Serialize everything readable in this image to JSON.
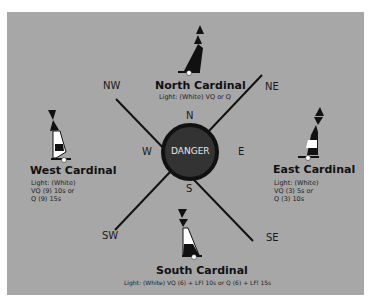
{
  "diagram": {
    "center": {
      "label": "DANGER",
      "fill": "#333333"
    },
    "directions": {
      "n": "N",
      "s": "S",
      "e": "E",
      "w": "W",
      "ne": "NE",
      "nw": "NW",
      "se": "SE",
      "sw": "SW"
    },
    "buoys": {
      "north": {
        "title": "North Cardinal",
        "light": "Light: (White) VQ or Q"
      },
      "east": {
        "title": "East Cardinal",
        "light_lines": [
          "Light: (White)",
          "VQ (3) 5s or",
          "Q (3) 10s"
        ]
      },
      "south": {
        "title": "South Cardinal",
        "light": "Light: (White) VQ (6) + LFl 10s or Q (6) + LFl 15s"
      },
      "west": {
        "title": "West Cardinal",
        "light_lines": [
          "Light: (White)",
          "VQ (9) 10s or",
          "Q (9) 15s"
        ]
      }
    },
    "colors": {
      "background": "#a7a7a7",
      "line": "#111111",
      "buoy_black": "#111111",
      "buoy_white": "#ffffff"
    }
  }
}
